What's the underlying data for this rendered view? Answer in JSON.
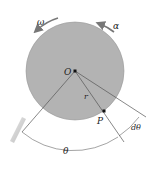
{
  "diagram": {
    "type": "rotating-disk-kinematics",
    "labels": {
      "omega": "ω",
      "alpha": "α",
      "center": "O",
      "radius": "r",
      "point": "P",
      "d_theta": "dθ",
      "theta": "θ"
    },
    "colors": {
      "disk_fill": "#b3b3b3",
      "disk_stroke": "#8a8a8a",
      "line": "#555555",
      "arrow": "#7a7a7a",
      "point": "#111111"
    }
  }
}
